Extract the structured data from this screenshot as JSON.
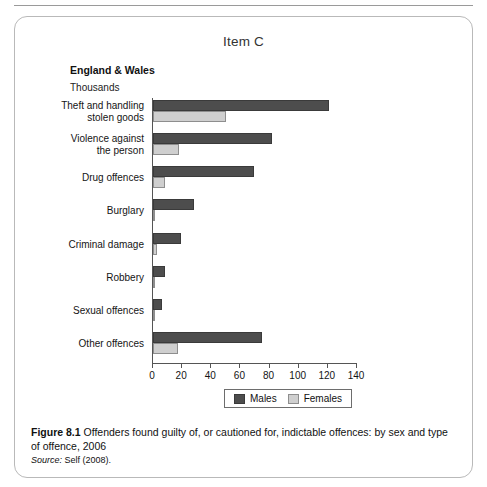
{
  "item_title": "Item C",
  "region_label": "England & Wales",
  "units_label": "Thousands",
  "legend": {
    "males_label": "Males",
    "females_label": "Females"
  },
  "caption": {
    "figure_number": "Figure 8.1",
    "text": "Offenders found guilty of, or cautioned for, indictable offences: by sex and type of offence, 2006",
    "source_prefix": "Source:",
    "source_text": "Self (2008)."
  },
  "colors": {
    "males": "#4d4d4d",
    "females": "#cfcfcf",
    "border": "#b9b9b9",
    "axis": "#555555"
  },
  "chart_data": {
    "type": "bar",
    "orientation": "horizontal",
    "title": "Item C",
    "subtitle": "England & Wales",
    "xlabel": "Thousands",
    "ylabel": "",
    "xlim": [
      0,
      140
    ],
    "xticks": [
      0,
      20,
      40,
      60,
      80,
      100,
      120,
      140
    ],
    "grid": false,
    "legend_position": "bottom",
    "categories": [
      "Theft and handling stolen goods",
      "Violence against the person",
      "Drug offences",
      "Burglary",
      "Criminal damage",
      "Robbery",
      "Sexual offences",
      "Other offences"
    ],
    "category_lines": [
      [
        "Theft and handling",
        "stolen goods"
      ],
      [
        "Violence against",
        "the person"
      ],
      [
        "Drug offences"
      ],
      [
        "Burglary"
      ],
      [
        "Criminal damage"
      ],
      [
        "Robbery"
      ],
      [
        "Sexual offences"
      ],
      [
        "Other offences"
      ]
    ],
    "series": [
      {
        "name": "Males",
        "values": [
          121,
          82,
          69,
          28,
          19,
          8,
          6,
          75
        ]
      },
      {
        "name": "Females",
        "values": [
          50,
          18,
          8,
          1.5,
          3,
          1,
          0.5,
          17
        ]
      }
    ]
  }
}
